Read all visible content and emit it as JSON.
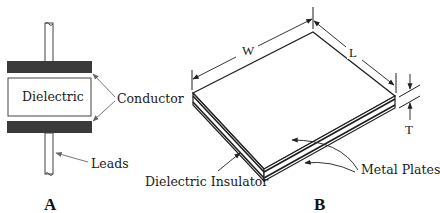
{
  "figure_a": {
    "caption": "A",
    "labels": {
      "dielectric": "Dielectric",
      "conductor": "Conductor",
      "leads": "Leads"
    }
  },
  "figure_b": {
    "caption": "B",
    "dimensions": {
      "width": "W",
      "length": "L",
      "thickness": "T"
    },
    "labels": {
      "dielectric_insulator": "Dielectric Insulator",
      "metal_plates": "Metal Plates"
    }
  },
  "colors": {
    "conductor_fill": "#3a3a3a",
    "line": "#222222",
    "background": "#ffffff"
  }
}
